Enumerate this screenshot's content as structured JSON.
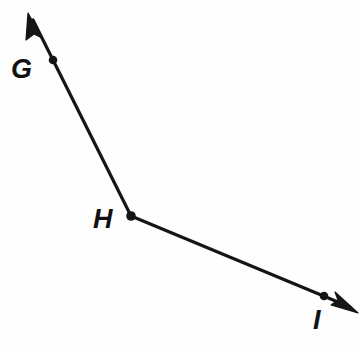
{
  "figure": {
    "background_color": "#fefefe",
    "stroke_color": "#151515",
    "label_color": "#111111",
    "width": 360,
    "height": 351
  },
  "points": [
    {
      "id": "G",
      "label": "G",
      "role": "ray-point",
      "dot": {
        "cx": 53,
        "cy": 60,
        "r": 4.3
      },
      "label_pos": {
        "x": 11,
        "y": 78
      },
      "font_size": 27
    },
    {
      "id": "H",
      "label": "H",
      "role": "vertex",
      "dot": {
        "cx": 131,
        "cy": 216,
        "r": 4.8
      },
      "label_pos": {
        "x": 93,
        "y": 228
      },
      "font_size": 27
    },
    {
      "id": "I",
      "label": "I",
      "role": "ray-point",
      "dot": {
        "cx": 324,
        "cy": 296,
        "r": 4.3
      },
      "label_pos": {
        "x": 313,
        "y": 329
      },
      "font_size": 27
    }
  ],
  "rays": [
    {
      "id": "ray-HG",
      "name": "ray-h-to-g",
      "from": "H",
      "through": "G",
      "start": {
        "x": 131,
        "y": 216
      },
      "end": {
        "x": 33,
        "y": 20
      },
      "arrow_at_end": true,
      "arrow_tip": {
        "x": 28,
        "y": 13
      },
      "stroke_width": 3.2
    },
    {
      "id": "ray-HI",
      "name": "ray-h-to-i",
      "from": "H",
      "through": "I",
      "start": {
        "x": 131,
        "y": 216
      },
      "end": {
        "x": 350,
        "y": 307
      },
      "arrow_at_end": true,
      "arrow_tip": {
        "x": 358,
        "y": 313
      },
      "stroke_width": 3.2
    }
  ],
  "arrowheads": [
    {
      "id": "arrowhead-upper-left",
      "name": "arrowhead-ray-hg",
      "tip": {
        "x": 28,
        "y": 13
      },
      "polygon": "28,13 42,38 34,34 26,40"
    },
    {
      "id": "arrowhead-lower-right",
      "name": "arrowhead-ray-hi",
      "tip": {
        "x": 358,
        "y": 313
      },
      "polygon": "358,313 331,305 338,300 335,292"
    }
  ]
}
